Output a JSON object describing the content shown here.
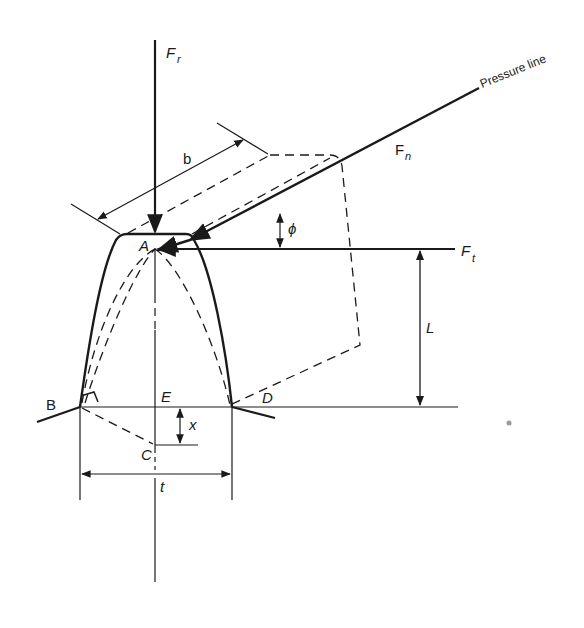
{
  "diagram": {
    "type": "gear tooth force diagram (Lewis beam model)",
    "colors": {
      "line": "#1a1a1a",
      "background": "#ffffff"
    },
    "labels": {
      "radial_force": "F",
      "radial_force_sub": "r",
      "normal_force": "F",
      "normal_force_sub": "n",
      "tangential_force": "F",
      "tangential_force_sub": "t",
      "pressure_line": "Pressure line",
      "face_width": "b",
      "pressure_angle": "ϕ",
      "point_a": "A",
      "point_b": "B",
      "point_c": "C",
      "point_d": "D",
      "point_e": "E",
      "lever_length": "L",
      "offset": "x",
      "thickness": "t"
    }
  }
}
